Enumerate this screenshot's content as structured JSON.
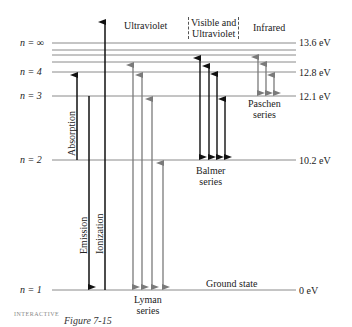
{
  "figure": {
    "caption_partial": "Figure 7-15",
    "logo_text": "INTERACTIVE"
  },
  "levels": [
    {
      "n_label": "n = ∞",
      "energy_label": "13.6 eV",
      "y": 43
    },
    {
      "n_label": "",
      "energy_label": "",
      "y": 50
    },
    {
      "n_label": "",
      "energy_label": "",
      "y": 55
    },
    {
      "n_label": "",
      "energy_label": "",
      "y": 62
    },
    {
      "n_label": "n = 4",
      "energy_label": "12.8 eV",
      "y": 72
    },
    {
      "n_label": "n = 3",
      "energy_label": "12.1 eV",
      "y": 96
    },
    {
      "n_label": "n = 2",
      "energy_label": "10.2 eV",
      "y": 160
    },
    {
      "n_label": "n = 1",
      "energy_label": "0 eV",
      "y": 290
    }
  ],
  "regions": {
    "ultraviolet": "Ultraviolet",
    "visible_uv_line1": "Visible and",
    "visible_uv_line2": "Ultraviolet",
    "infrared": "Infrared"
  },
  "series": {
    "lyman_line1": "Lyman",
    "lyman_line2": "series",
    "balmer_line1": "Balmer",
    "balmer_line2": "series",
    "paschen_line1": "Paschen",
    "paschen_line2": "series"
  },
  "process_labels": {
    "absorption": "Absorption",
    "emission": "Emission",
    "ionization": "Ionization",
    "ground_state": "Ground state"
  },
  "colors": {
    "level_line": "#8a8a8a",
    "black_arrow": "#111111",
    "gray_arrow": "#7a7a7a"
  }
}
